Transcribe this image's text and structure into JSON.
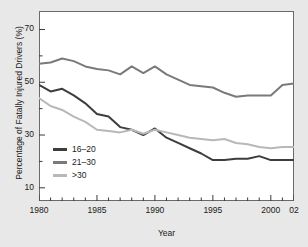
{
  "figure": {
    "background_color": "#e8e8e8",
    "plot_background_color": "#ffffff",
    "frame_color": "#6a6a6a"
  },
  "chart_data": {
    "type": "line",
    "title": "",
    "xlabel": "Year",
    "ylabel": "Percentage of Fatally Injured Drivers (%)",
    "xlim": [
      1980,
      2002
    ],
    "ylim": [
      5,
      77
    ],
    "grid": false,
    "legend_position": "lower-left-inside",
    "x_major_ticks": [
      1980,
      1985,
      1990,
      1995,
      2000,
      2002
    ],
    "x_major_tick_labels": [
      "1980",
      "1985",
      "1990",
      "1995",
      "2000",
      "02"
    ],
    "x_minor_tick_interval": 1,
    "y_major_ticks": [
      10,
      30,
      50,
      70
    ],
    "y_major_tick_labels": [
      "10",
      "30",
      "50",
      "70"
    ],
    "y_minor_ticks": [
      20,
      40,
      60
    ],
    "x": [
      1980,
      1981,
      1982,
      1983,
      1984,
      1985,
      1986,
      1987,
      1988,
      1989,
      1990,
      1991,
      1992,
      1993,
      1994,
      1995,
      1996,
      1997,
      1998,
      1999,
      2000,
      2001,
      2002
    ],
    "series": [
      {
        "name": "16-20",
        "label": "16–20",
        "color": "#3d3d3d",
        "values": [
          49,
          46.5,
          47.5,
          45,
          42,
          38,
          37,
          33,
          32,
          30,
          32.5,
          29,
          27,
          25,
          23,
          20.5,
          20.5,
          21,
          21,
          22,
          20.5,
          20.5,
          20.5
        ]
      },
      {
        "name": "21-30",
        "label": "21–30",
        "color": "#7a7a7a",
        "values": [
          57,
          57.5,
          59,
          58,
          56,
          55,
          54.5,
          53,
          56,
          53.5,
          56,
          53,
          51,
          49,
          48.5,
          48,
          46,
          44.5,
          45,
          45,
          45,
          49,
          49.5
        ]
      },
      {
        "name": ">30",
        "label": ">30",
        "color": "#b8b8b8",
        "values": [
          44,
          41,
          39.5,
          37,
          35,
          32,
          31.5,
          31,
          32,
          30.5,
          32,
          31,
          30,
          29,
          28.5,
          28,
          28.5,
          27,
          26.5,
          25.5,
          25,
          25.5,
          25.5
        ]
      }
    ]
  },
  "legend": {
    "items": [
      {
        "label": "16–20",
        "color": "#3d3d3d"
      },
      {
        "label": "21–30",
        "color": "#7a7a7a"
      },
      {
        "label": ">30",
        "color": "#b8b8b8"
      }
    ]
  }
}
